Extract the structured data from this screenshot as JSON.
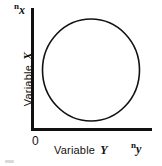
{
  "figure": {
    "background_color": "#ffffff",
    "ink_color": "#111111",
    "width": 162,
    "height": 166
  },
  "axes": {
    "x_axis": {
      "title": "Variable",
      "variable_letter": "Y",
      "end_symbol_base": "n",
      "end_symbol_subscript": "y",
      "origin_label": "0"
    },
    "y_axis": {
      "title": "Variable",
      "variable_letter": "X",
      "end_symbol_base": "n",
      "end_symbol_subscript": "x"
    }
  },
  "chart_data": {
    "type": "line",
    "title": "",
    "subtitle": "",
    "xlabel": "Variable Y",
    "ylabel": "Variable X",
    "xlim": [
      0,
      1
    ],
    "ylim": [
      0,
      1
    ],
    "xticks": [
      "0"
    ],
    "yticks": [],
    "grid": false,
    "legend": null,
    "annotations": [
      {
        "text": "n_x",
        "position": "y-axis-top"
      },
      {
        "text": "n_y",
        "position": "x-axis-right"
      },
      {
        "text": "0",
        "position": "origin"
      }
    ],
    "series": [
      {
        "name": "closed contour",
        "shape": "circle",
        "closed": true,
        "fill": "none",
        "stroke": "#111111",
        "stroke_width": 1.6,
        "center_x": 0.53,
        "center_y": 0.55,
        "radius_x": 0.4,
        "radius_y": 0.42,
        "center_px": [
          91,
          70
        ],
        "radius_px": [
          48.5,
          51
        ]
      }
    ]
  }
}
